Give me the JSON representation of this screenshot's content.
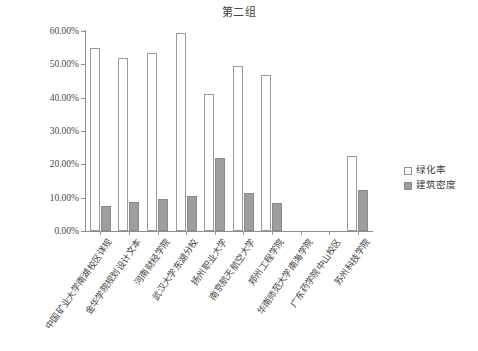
{
  "chart_data": {
    "type": "bar",
    "title": "第二组",
    "xlabel": "",
    "ylabel": "",
    "ylim": [
      0,
      60
    ],
    "ytick_labels": [
      "0.00%",
      "10.00%",
      "20.00%",
      "30.00%",
      "40.00%",
      "50.00%",
      "60.00%"
    ],
    "ytick_values": [
      0,
      10,
      20,
      30,
      40,
      50,
      60
    ],
    "grid": false,
    "legend_position": "right",
    "categories": [
      "中国矿业大学南湖校区详规",
      "金华学院规划设计文本",
      "河南财经学院",
      "武汉大学东湖分校",
      "扬州职业大学",
      "南京航天航空大学",
      "郑州工程学院",
      "华南师范大学南海学院",
      "广东药学院中山校区",
      "苏州科技学院"
    ],
    "series": [
      {
        "name": "绿化率",
        "color": "#ffffff",
        "values": [
          55.0,
          52.0,
          53.5,
          59.3,
          41.2,
          49.5,
          46.8,
          null,
          null,
          22.5
        ]
      },
      {
        "name": "建筑密度",
        "color": "#9e9e9e",
        "values": [
          7.5,
          8.6,
          9.6,
          10.4,
          21.9,
          11.5,
          8.3,
          null,
          null,
          12.2
        ]
      }
    ]
  },
  "legend": {
    "items": [
      {
        "label": "绿化率",
        "swatch": "green"
      },
      {
        "label": "建筑密度",
        "swatch": "dens"
      }
    ]
  }
}
